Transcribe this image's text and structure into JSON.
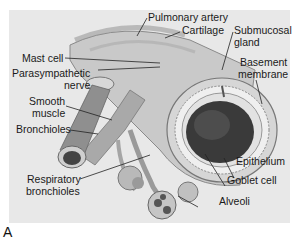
{
  "figure": {
    "panel_letter": "A",
    "background": "#e8e8e8",
    "tissue_colors": {
      "airway": "#bdbdbd",
      "lumen": "#3a3a3a",
      "highlight": "#f2f2f2"
    }
  },
  "labels": {
    "pulmonary_artery": "Pulmonary artery",
    "cartilage": "Cartilage",
    "submucosal_gland_1": "Submucosal",
    "submucosal_gland_2": "gland",
    "basement_membrane_1": "Basement",
    "basement_membrane_2": "membrane",
    "mast_cell": "Mast cell",
    "parasympathetic_nerve_1": "Parasympathetic",
    "parasympathetic_nerve_2": "nerve",
    "smooth_muscle_1": "Smooth",
    "smooth_muscle_2": "muscle",
    "bronchioles": "Bronchioles",
    "respiratory_bronchioles_1": "Respiratory",
    "respiratory_bronchioles_2": "bronchioles",
    "epithelium": "Epithelium",
    "goblet_cell": "Goblet cell",
    "alveoli": "Alveoli"
  }
}
